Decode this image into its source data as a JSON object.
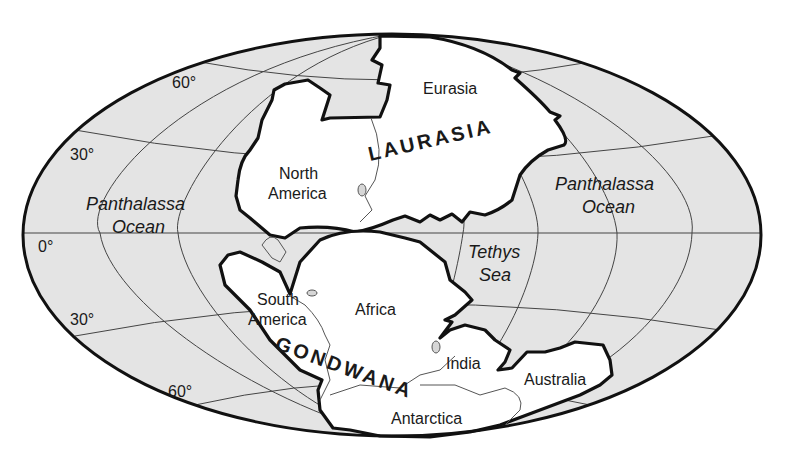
{
  "map": {
    "title": "Pangaea supercontinent",
    "projection": "elliptical (Mollweide-style) world map",
    "colors": {
      "ocean": "#e4e4e4",
      "land": "#ffffff",
      "outline": "#111111",
      "graticule": "#444444"
    },
    "latitude_labels": {
      "north_60": "60°",
      "north_30": "30°",
      "equator": "0°",
      "south_30": "30°",
      "south_60": "60°"
    },
    "supercontinents": {
      "north": "LAURASIA",
      "south": "GONDWANA"
    },
    "continents": {
      "eurasia": "Eurasia",
      "north_america_line1": "North",
      "north_america_line2": "America",
      "south_america_line1": "South",
      "south_america_line2": "America",
      "africa": "Africa",
      "india": "India",
      "australia": "Australia",
      "antarctica": "Antarctica"
    },
    "water_bodies": {
      "panthalassa_west_line1": "Panthalassa",
      "panthalassa_west_line2": "Ocean",
      "panthalassa_east_line1": "Panthalassa",
      "panthalassa_east_line2": "Ocean",
      "tethys_line1": "Tethys",
      "tethys_line2": "Sea"
    }
  }
}
